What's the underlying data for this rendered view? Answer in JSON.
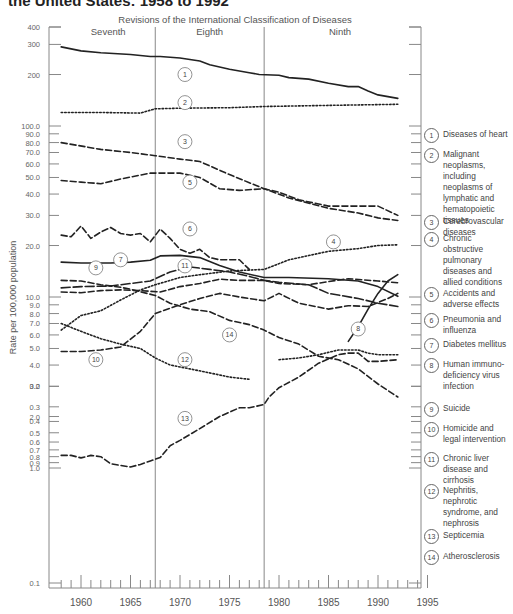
{
  "title": "the United States: 1958 to 1992",
  "chart_data": {
    "type": "line",
    "title": "the United States: 1958 to 1992",
    "subtitle": "Revisions of the International Classification of Diseases",
    "xlabel": "",
    "ylabel": "Rate per 100,000 population",
    "yscale": "log",
    "xlim": [
      1957,
      1995
    ],
    "ylim": [
      0.1,
      400
    ],
    "x_ticks": [
      1960,
      1965,
      1970,
      1975,
      1980,
      1985,
      1990,
      1995
    ],
    "y_ticks": [
      {
        "value": 400,
        "label": "400"
      },
      {
        "value": 300,
        "label": "300"
      },
      {
        "value": 200,
        "label": "200"
      },
      {
        "value": 100,
        "label": "100.0"
      },
      {
        "value": 90,
        "label": "90.0"
      },
      {
        "value": 80,
        "label": "80.0"
      },
      {
        "value": 70,
        "label": "70.0"
      },
      {
        "value": 60,
        "label": "60.0"
      },
      {
        "value": 50,
        "label": "50.0"
      },
      {
        "value": 40,
        "label": "40.0"
      },
      {
        "value": 30,
        "label": "30.0"
      },
      {
        "value": 20,
        "label": "20.0"
      },
      {
        "value": 10,
        "label": "10.0"
      },
      {
        "value": 9,
        "label": "9.0"
      },
      {
        "value": 8,
        "label": "8.0"
      },
      {
        "value": 7,
        "label": "7.0"
      },
      {
        "value": 6,
        "label": "6.0"
      },
      {
        "value": 5,
        "label": "5.0"
      },
      {
        "value": 4,
        "label": "4.0"
      },
      {
        "value": 3,
        "label": "3.0"
      },
      {
        "value": 2,
        "label": "2.0"
      },
      {
        "value": 1,
        "label": "1.0"
      },
      {
        "value": 0.9,
        "label": "0.9"
      },
      {
        "value": 0.8,
        "label": "0.8"
      },
      {
        "value": 0.7,
        "label": "0.7"
      },
      {
        "value": 0.6,
        "label": "0.6"
      },
      {
        "value": 0.5,
        "label": "0.5"
      },
      {
        "value": 0.4,
        "label": "0.4"
      },
      {
        "value": 0.3,
        "label": "0.3"
      },
      {
        "value": 0.2,
        "label": "0.2"
      },
      {
        "value": 0.1,
        "label": "0.1"
      }
    ],
    "grid": false,
    "legend_position": "right",
    "revisions": [
      {
        "label": "Seventh",
        "start": 1958,
        "end": 1967.5
      },
      {
        "label": "Eighth",
        "start": 1967.5,
        "end": 1978.5
      },
      {
        "label": "Ninth",
        "start": 1978.5,
        "end": 1992
      }
    ],
    "series": [
      {
        "id": 1,
        "name": "Diseases of heart",
        "style": "solid",
        "x": [
          1958,
          1960,
          1962,
          1965,
          1967,
          1968,
          1970,
          1972,
          1973,
          1975,
          1977,
          1978,
          1980,
          1981,
          1983,
          1985,
          1987,
          1988,
          1989,
          1990,
          1992
        ],
        "values": [
          290,
          275,
          268,
          262,
          255,
          255,
          250,
          240,
          228,
          215,
          205,
          200,
          198,
          192,
          188,
          178,
          170,
          170,
          160,
          152,
          145
        ],
        "label_pos": [
          1970.5,
          200
        ]
      },
      {
        "id": 2,
        "name": "Malignant neoplasms, including neoplasms of lymphatic and hematopoietic tissues",
        "style": "dotted",
        "x": [
          1958,
          1962,
          1966,
          1967.5,
          1970,
          1975,
          1978.5,
          1985,
          1992
        ],
        "values": [
          120,
          120,
          119,
          126,
          127,
          128,
          130,
          132,
          134
        ],
        "label_pos": [
          1970.5,
          137
        ]
      },
      {
        "id": 3,
        "name": "Cerebrovascular diseases",
        "style": "dashed",
        "x": [
          1958,
          1962,
          1965,
          1967.5,
          1970,
          1972,
          1975,
          1978.5,
          1981,
          1985,
          1988,
          1990,
          1992
        ],
        "values": [
          80,
          73,
          70,
          67,
          64,
          62,
          52,
          43,
          38,
          33,
          31,
          29,
          28
        ],
        "label_pos": [
          1970.5,
          81
        ]
      },
      {
        "id": 4,
        "name": "Chronic obstructive pulmonary diseases and allied conditions",
        "style": "dotted",
        "x": [
          1958,
          1960,
          1962,
          1964,
          1966,
          1967.5,
          1970,
          1972,
          1975,
          1978.5,
          1981,
          1985,
          1988,
          1990,
          1992
        ],
        "values": [
          6.4,
          7.8,
          8.3,
          9.6,
          11.0,
          11.8,
          13.0,
          13.5,
          14.2,
          14.5,
          16.5,
          18.5,
          19.2,
          20.0,
          20.2
        ],
        "label_pos": [
          1985.5,
          21
        ]
      },
      {
        "id": 5,
        "name": "Accidents and adverse effects",
        "style": "dashed",
        "x": [
          1958,
          1960,
          1962,
          1964,
          1967,
          1970,
          1972,
          1974,
          1976,
          1978.5,
          1980,
          1982,
          1985,
          1987,
          1990,
          1992
        ],
        "values": [
          48,
          47,
          46,
          49,
          53,
          53,
          50,
          43,
          42,
          43,
          41,
          37,
          34,
          34,
          34,
          30
        ],
        "label_pos": [
          1971,
          47
        ]
      },
      {
        "id": 6,
        "name": "Pneumonia and influenza",
        "style": "dashed",
        "x": [
          1958,
          1959,
          1960,
          1961,
          1962,
          1963,
          1964,
          1965,
          1966,
          1967,
          1968,
          1969,
          1970,
          1971,
          1972,
          1973,
          1974,
          1975,
          1976,
          1977
        ],
        "values": [
          23,
          22.5,
          26,
          22,
          24,
          25.5,
          23.5,
          23,
          23.5,
          21,
          25,
          22,
          19,
          18,
          19,
          17,
          16.5,
          16.5,
          16.5,
          14.5
        ],
        "label_pos": [
          1971,
          25
        ]
      },
      {
        "id": 7,
        "name": "Diabetes mellitus",
        "style": "solid",
        "x": [
          1958,
          1960,
          1963,
          1965,
          1967,
          1968,
          1970,
          1972,
          1974,
          1976,
          1978.5,
          1981,
          1985,
          1988,
          1990,
          1992
        ],
        "values": [
          16.0,
          15.8,
          15.8,
          16.0,
          16.4,
          17.4,
          17.5,
          17.0,
          15.3,
          14.0,
          13.0,
          13.0,
          12.8,
          12.4,
          11.5,
          10.1
        ],
        "label_pos": [
          1964,
          16.5
        ]
      },
      {
        "id": 8,
        "name": "Human immunodeficiency virus infection",
        "style": "solid",
        "x": [
          1987,
          1988,
          1989,
          1990,
          1991,
          1992
        ],
        "values": [
          5.5,
          6.7,
          8.5,
          10.5,
          12.4,
          13.5
        ],
        "label_pos": [
          1988,
          6.5
        ]
      },
      {
        "id": 9,
        "name": "Suicide",
        "style": "dashed",
        "x": [
          1958,
          1960,
          1962,
          1964,
          1966,
          1968,
          1970,
          1972,
          1974,
          1976,
          1978.5,
          1980,
          1983,
          1985,
          1987,
          1990,
          1992
        ],
        "values": [
          10.7,
          10.6,
          10.9,
          11.0,
          10.9,
          10.7,
          11.5,
          12.0,
          12.7,
          12.5,
          12.5,
          12.0,
          11.8,
          12.3,
          12.8,
          12.4,
          12.1
        ],
        "label_pos": [
          1961.5,
          14.8
        ]
      },
      {
        "id": 10,
        "name": "Homicide and legal intervention",
        "style": "dashed",
        "x": [
          1958,
          1960,
          1962,
          1964,
          1966,
          1967.5,
          1968,
          1970,
          1972,
          1974,
          1976,
          1978.5,
          1980,
          1982,
          1985,
          1987,
          1989,
          1991,
          1992
        ],
        "values": [
          4.8,
          4.8,
          4.9,
          5.1,
          6.3,
          8.0,
          8.2,
          9.0,
          9.8,
          10.5,
          10.0,
          9.5,
          10.5,
          9.2,
          8.5,
          8.9,
          8.8,
          9.8,
          10.5
        ],
        "label_pos": [
          1961.5,
          4.3
        ]
      },
      {
        "id": 11,
        "name": "Chronic liver disease and cirrhosis",
        "style": "long-dash",
        "x": [
          1958,
          1960,
          1963,
          1965,
          1967,
          1969,
          1971,
          1973,
          1975,
          1977,
          1978.5,
          1980,
          1983,
          1985,
          1988,
          1990,
          1992
        ],
        "values": [
          11.3,
          11.5,
          11.6,
          12.0,
          12.4,
          14.0,
          15.0,
          14.5,
          14.0,
          13.2,
          12.5,
          12.2,
          11.8,
          10.5,
          9.8,
          9.2,
          8.8
        ],
        "label_pos": [
          1970.5,
          15.2
        ]
      },
      {
        "id": 12,
        "name": "Nephritis, nephrotic syndrome, and nephrosis",
        "style": "dotted",
        "x": [
          1958,
          1960,
          1962,
          1964,
          1966,
          1967.5,
          1969,
          1971,
          1973,
          1975,
          1977
        ],
        "values": [
          7.0,
          6.3,
          5.7,
          5.3,
          5.0,
          4.4,
          4.0,
          3.8,
          3.6,
          3.4,
          3.3
        ],
        "label_pos": [
          1970.5,
          4.3
        ]
      },
      {
        "id": 12,
        "name": "Nephritis, nephrotic syndrome, and nephrosis (Ninth revision)",
        "style": "dotted",
        "x": [
          1980,
          1982,
          1984,
          1986,
          1988,
          1989,
          1990,
          1992
        ],
        "values": [
          4.3,
          4.4,
          4.6,
          4.9,
          4.9,
          4.7,
          4.6,
          4.6
        ]
      },
      {
        "id": 13,
        "name": "Septicemia",
        "style": "dashed",
        "x": [
          1958,
          1959,
          1960,
          1961,
          1962,
          1963,
          1964,
          1965,
          1966,
          1967,
          1968,
          1969,
          1970,
          1972,
          1974,
          1976,
          1977,
          1978.5,
          1979,
          1980,
          1982,
          1984,
          1986,
          1987,
          1988,
          1989,
          1990,
          1992
        ],
        "values": [
          0.78,
          0.78,
          0.82,
          0.78,
          0.8,
          0.92,
          0.95,
          0.98,
          1.05,
          1.1,
          1.15,
          1.35,
          1.45,
          1.7,
          2.0,
          2.25,
          2.25,
          2.35,
          2.6,
          2.95,
          3.4,
          4.1,
          4.6,
          4.7,
          4.7,
          4.2,
          4.2,
          4.3
        ],
        "label_pos": [
          1970.5,
          1.95
        ]
      },
      {
        "id": 14,
        "name": "Atherosclerosis",
        "style": "dashed",
        "x": [
          1958,
          1960,
          1962,
          1964,
          1965,
          1967.5,
          1969,
          1971,
          1973,
          1975,
          1977,
          1978.5,
          1980,
          1982,
          1984,
          1986,
          1988,
          1990,
          1992
        ],
        "values": [
          12.5,
          12.4,
          11.8,
          11.4,
          11.1,
          10.2,
          9.2,
          8.5,
          8.2,
          7.3,
          6.9,
          6.4,
          5.8,
          5.3,
          4.5,
          4.3,
          3.8,
          3.1,
          2.6
        ],
        "label_pos": [
          1975,
          6.0
        ]
      }
    ]
  },
  "legend": [
    {
      "num": "1",
      "label": "Diseases of heart"
    },
    {
      "num": "2",
      "label": "Malignant neoplasms, including neoplasms of lymphatic and hematopoietic tissues"
    },
    {
      "num": "3",
      "label": "Cerebrovascular diseases"
    },
    {
      "num": "4",
      "label": "Chronic obstructive pulmonary diseases and allied conditions"
    },
    {
      "num": "5",
      "label": "Accidents and adverse effects"
    },
    {
      "num": "6",
      "label": "Pneumonia and influenza"
    },
    {
      "num": "7",
      "label": "Diabetes mellitus"
    },
    {
      "num": "8",
      "label": "Human immuno- deficiency virus infection"
    },
    {
      "num": "9",
      "label": "Suicide"
    },
    {
      "num": "10",
      "label": "Homicide and legal intervention"
    },
    {
      "num": "11",
      "label": "Chronic liver disease and cirrhosis"
    },
    {
      "num": "12",
      "label": "Nephritis, nephrotic syndrome, and nephrosis"
    },
    {
      "num": "13",
      "label": "Septicemia"
    },
    {
      "num": "14",
      "label": "Atherosclerosis"
    }
  ]
}
